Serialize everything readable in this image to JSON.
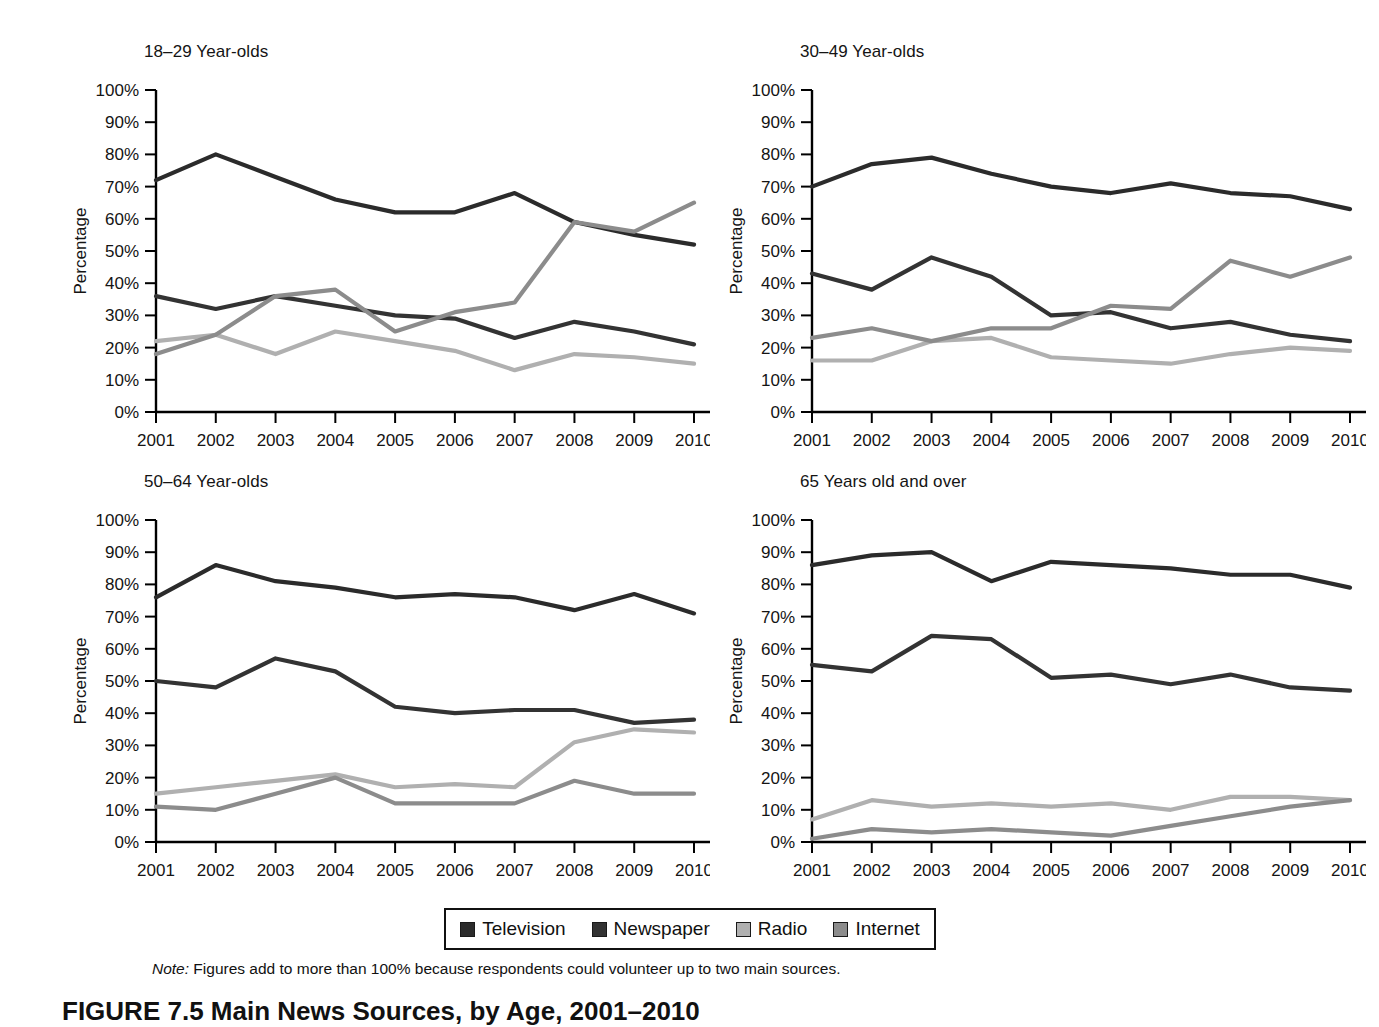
{
  "figure": {
    "note_label": "Note:",
    "note_text": " Figures add to more than 100% because respondents could volunteer up to two main sources.",
    "caption": "FIGURE 7.5  Main News Sources, by Age, 2001–2010"
  },
  "legend": {
    "items": [
      {
        "label": "Television",
        "color": "#2b2b2b"
      },
      {
        "label": "Newspaper",
        "color": "#333333"
      },
      {
        "label": "Radio",
        "color": "#b0b0b0"
      },
      {
        "label": "Internet",
        "color": "#8c8c8c"
      }
    ]
  },
  "axes": {
    "ylabel": "Percentage",
    "yticks": [
      "0%",
      "10%",
      "20%",
      "30%",
      "40%",
      "50%",
      "60%",
      "70%",
      "80%",
      "90%",
      "100%"
    ],
    "xticks": [
      "2001",
      "2002",
      "2003",
      "2004",
      "2005",
      "2006",
      "2007",
      "2008",
      "2009",
      "2010"
    ]
  },
  "chart_data": {
    "type": "line",
    "title": "Main News Sources, by Age, 2001–2010",
    "xlabel": "",
    "ylabel": "Percentage",
    "x": [
      2001,
      2002,
      2003,
      2004,
      2005,
      2006,
      2007,
      2008,
      2009,
      2010
    ],
    "ylim": [
      0,
      100
    ],
    "grid": false,
    "legend_position": "bottom-center",
    "annotations": [
      "Note: Figures add to more than 100% because respondents could volunteer up to two main sources."
    ],
    "panels": [
      {
        "title": "18–29 Year-olds",
        "series": [
          {
            "name": "Television",
            "color": "#2b2b2b",
            "values": [
              72,
              80,
              73,
              66,
              62,
              62,
              68,
              59,
              55,
              52
            ]
          },
          {
            "name": "Newspaper",
            "color": "#333333",
            "values": [
              36,
              32,
              36,
              33,
              30,
              29,
              23,
              28,
              25,
              21
            ]
          },
          {
            "name": "Radio",
            "color": "#b0b0b0",
            "values": [
              22,
              24,
              18,
              25,
              22,
              19,
              13,
              18,
              17,
              15
            ]
          },
          {
            "name": "Internet",
            "color": "#8c8c8c",
            "values": [
              18,
              24,
              36,
              38,
              25,
              31,
              34,
              59,
              56,
              65
            ]
          }
        ]
      },
      {
        "title": "30–49 Year-olds",
        "series": [
          {
            "name": "Television",
            "color": "#2b2b2b",
            "values": [
              70,
              77,
              79,
              74,
              70,
              68,
              71,
              68,
              67,
              63
            ]
          },
          {
            "name": "Newspaper",
            "color": "#333333",
            "values": [
              43,
              38,
              48,
              42,
              30,
              31,
              26,
              28,
              24,
              22
            ]
          },
          {
            "name": "Radio",
            "color": "#b0b0b0",
            "values": [
              16,
              16,
              22,
              23,
              17,
              16,
              15,
              18,
              20,
              19
            ]
          },
          {
            "name": "Internet",
            "color": "#8c8c8c",
            "values": [
              23,
              26,
              22,
              26,
              26,
              33,
              32,
              47,
              42,
              48
            ]
          }
        ]
      },
      {
        "title": "50–64 Year-olds",
        "series": [
          {
            "name": "Television",
            "color": "#2b2b2b",
            "values": [
              76,
              86,
              81,
              79,
              76,
              77,
              76,
              72,
              77,
              71
            ]
          },
          {
            "name": "Newspaper",
            "color": "#333333",
            "values": [
              50,
              48,
              57,
              53,
              42,
              40,
              41,
              41,
              37,
              38
            ]
          },
          {
            "name": "Radio",
            "color": "#b0b0b0",
            "values": [
              15,
              17,
              19,
              21,
              17,
              18,
              17,
              31,
              35,
              34
            ]
          },
          {
            "name": "Internet",
            "color": "#8c8c8c",
            "values": [
              11,
              10,
              15,
              20,
              12,
              12,
              12,
              19,
              15,
              15
            ]
          }
        ]
      },
      {
        "title": "65 Years old and over",
        "series": [
          {
            "name": "Television",
            "color": "#2b2b2b",
            "values": [
              86,
              89,
              90,
              81,
              87,
              86,
              85,
              83,
              83,
              79
            ]
          },
          {
            "name": "Newspaper",
            "color": "#333333",
            "values": [
              55,
              53,
              64,
              63,
              51,
              52,
              49,
              52,
              48,
              47
            ]
          },
          {
            "name": "Radio",
            "color": "#b0b0b0",
            "values": [
              7,
              13,
              11,
              12,
              11,
              12,
              10,
              14,
              14,
              13
            ]
          },
          {
            "name": "Internet",
            "color": "#8c8c8c",
            "values": [
              1,
              4,
              3,
              4,
              3,
              2,
              5,
              8,
              11,
              13
            ]
          }
        ]
      }
    ]
  }
}
